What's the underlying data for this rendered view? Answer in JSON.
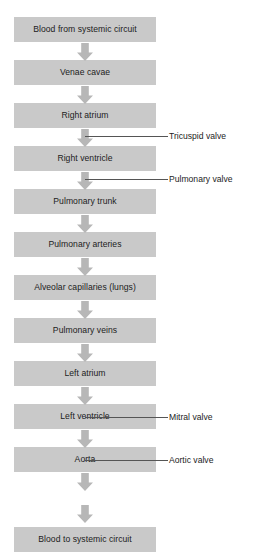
{
  "diagram": {
    "colors": {
      "box_fill": "#c9c9c9",
      "arrow_fill": "#b7b7b7",
      "text": "#1c1c1c",
      "line": "#555555",
      "background": "#ffffff"
    },
    "nodes": [
      {
        "label": "Blood from systemic circuit",
        "top": 17
      },
      {
        "label": "Venae cavae",
        "top": 60
      },
      {
        "label": "Right atrium",
        "top": 103
      },
      {
        "label": "Right ventricle",
        "top": 146
      },
      {
        "label": "Pulmonary trunk",
        "top": 189
      },
      {
        "label": "Pulmonary arteries",
        "top": 232
      },
      {
        "label": "Alveolar capillaries (lungs)",
        "top": 275
      },
      {
        "label": "Pulmonary veins",
        "top": 318
      },
      {
        "label": "Left atrium",
        "top": 361
      },
      {
        "label": "Left ventricle",
        "top": 404
      },
      {
        "label": "Aorta",
        "top": 447
      },
      {
        "label": "Blood to systemic circuit",
        "top": 527
      }
    ],
    "arrows": [
      {
        "top": 43
      },
      {
        "top": 86
      },
      {
        "top": 129
      },
      {
        "top": 172
      },
      {
        "top": 215
      },
      {
        "top": 258
      },
      {
        "top": 301
      },
      {
        "top": 344
      },
      {
        "top": 387
      },
      {
        "top": 430
      },
      {
        "top": 473
      },
      {
        "top": 505
      }
    ],
    "valve_annotations": [
      {
        "label": "Tricuspid valve",
        "top": 131
      },
      {
        "label": "Pulmonary valve",
        "top": 174
      },
      {
        "label": "Mitral valve",
        "top": 412
      },
      {
        "label": "Aortic valve",
        "top": 455
      }
    ]
  }
}
